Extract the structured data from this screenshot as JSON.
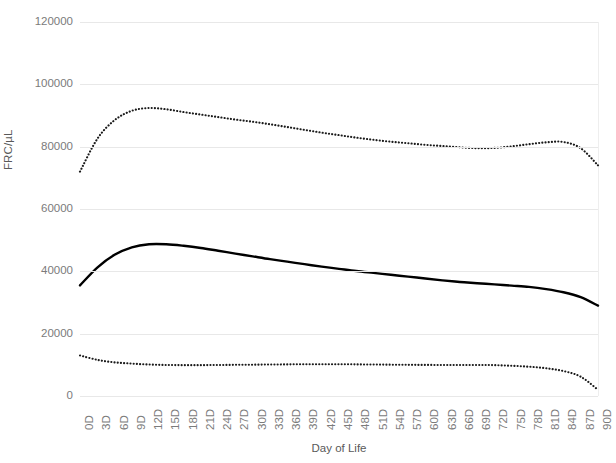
{
  "chart_data": {
    "type": "line",
    "title": "",
    "xlabel": "Day of Life",
    "ylabel": "FRC/µL",
    "xlim": [
      0,
      90
    ],
    "ylim": [
      0,
      120000
    ],
    "grid": true,
    "legend": "none",
    "y_ticks": [
      120000,
      100000,
      80000,
      60000,
      40000,
      20000,
      0
    ],
    "y_tick_labels": [
      "120000",
      "100000",
      "80000",
      "60000",
      "40000",
      "20000",
      "0"
    ],
    "x_ticks": [
      0,
      3,
      6,
      9,
      12,
      15,
      18,
      21,
      24,
      27,
      30,
      33,
      36,
      39,
      42,
      45,
      48,
      51,
      54,
      57,
      60,
      63,
      66,
      69,
      72,
      75,
      78,
      81,
      84,
      87,
      90
    ],
    "x_tick_labels": [
      "0D",
      "3D",
      "6D",
      "9D",
      "12D",
      "15D",
      "18D",
      "21D",
      "24D",
      "27D",
      "30D",
      "33D",
      "36D",
      "39D",
      "42D",
      "45D",
      "48D",
      "51D",
      "54D",
      "57D",
      "60D",
      "63D",
      "66D",
      "69D",
      "72D",
      "75D",
      "78D",
      "81D",
      "84D",
      "87D",
      "90D"
    ],
    "x": [
      0,
      3,
      6,
      9,
      12,
      15,
      18,
      21,
      24,
      27,
      30,
      33,
      36,
      39,
      42,
      45,
      48,
      51,
      54,
      57,
      60,
      63,
      66,
      69,
      72,
      75,
      78,
      81,
      84,
      87,
      90
    ],
    "series": [
      {
        "name": "upper-percentile",
        "style": "dotted",
        "color": "#1a1a1a",
        "values": [
          72000,
          82500,
          88500,
          91500,
          92400,
          92000,
          91100,
          90300,
          89500,
          88700,
          88000,
          87200,
          86300,
          85400,
          84500,
          83700,
          82900,
          82200,
          81600,
          81100,
          80600,
          80200,
          79800,
          79500,
          79600,
          80100,
          80800,
          81400,
          81500,
          79500,
          74000
        ]
      },
      {
        "name": "median",
        "style": "solid",
        "color": "#000000",
        "values": [
          35500,
          41200,
          45300,
          47700,
          48700,
          48700,
          48200,
          47500,
          46600,
          45700,
          44800,
          43900,
          43100,
          42300,
          41500,
          40800,
          40100,
          39500,
          38900,
          38300,
          37700,
          37100,
          36600,
          36200,
          35800,
          35400,
          35000,
          34300,
          33300,
          31700,
          29000
        ]
      },
      {
        "name": "lower-percentile",
        "style": "dotted",
        "color": "#1a1a1a",
        "values": [
          13000,
          11600,
          10800,
          10400,
          10100,
          9950,
          9900,
          9900,
          9950,
          10000,
          10050,
          10100,
          10150,
          10200,
          10200,
          10200,
          10150,
          10100,
          10050,
          10000,
          9980,
          9960,
          9950,
          9960,
          9900,
          9700,
          9400,
          8900,
          8000,
          6200,
          2000
        ]
      }
    ]
  }
}
